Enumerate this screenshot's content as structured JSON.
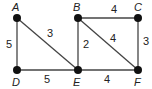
{
  "graph": {
    "nodes": [
      {
        "id": "A",
        "label": "A",
        "x": 17,
        "y": 18
      },
      {
        "id": "B",
        "label": "B",
        "x": 78,
        "y": 18
      },
      {
        "id": "C",
        "label": "C",
        "x": 138,
        "y": 18
      },
      {
        "id": "D",
        "label": "D",
        "x": 17,
        "y": 70
      },
      {
        "id": "E",
        "label": "E",
        "x": 78,
        "y": 70
      },
      {
        "id": "F",
        "label": "F",
        "x": 138,
        "y": 70
      }
    ],
    "edges": [
      {
        "from": "A",
        "to": "D",
        "weight": "5"
      },
      {
        "from": "A",
        "to": "E",
        "weight": "3"
      },
      {
        "from": "D",
        "to": "E",
        "weight": "5"
      },
      {
        "from": "B",
        "to": "C",
        "weight": "4"
      },
      {
        "from": "B",
        "to": "E",
        "weight": "2"
      },
      {
        "from": "B",
        "to": "F",
        "weight": "4"
      },
      {
        "from": "C",
        "to": "F",
        "weight": "3"
      },
      {
        "from": "E",
        "to": "F",
        "weight": "4"
      }
    ]
  }
}
